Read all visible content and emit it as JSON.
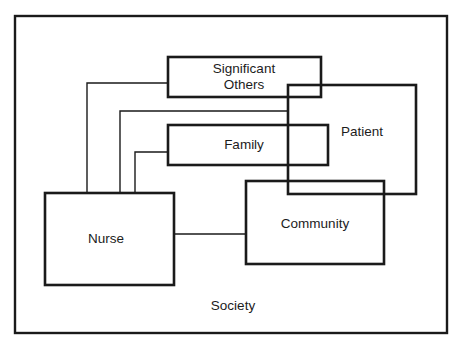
{
  "diagram": {
    "type": "nested-relationship-diagram",
    "stroke_color": "#1a1a1a",
    "background": "#ffffff",
    "nodes": [
      {
        "id": "society",
        "label": "Society",
        "box": [
          15,
          16,
          447,
          333
        ],
        "label_pos": [
          233,
          306
        ]
      },
      {
        "id": "significant_others",
        "label_line1": "Significant",
        "label_line2": "Others",
        "box": [
          168,
          57,
          321,
          97
        ],
        "label_pos": [
          244,
          77
        ]
      },
      {
        "id": "family",
        "label": "Family",
        "box": [
          168,
          125,
          328,
          165
        ],
        "label_pos": [
          244,
          145
        ]
      },
      {
        "id": "patient",
        "label": "Patient",
        "box": [
          288,
          85,
          416,
          194
        ],
        "label_pos": [
          362,
          132
        ]
      },
      {
        "id": "community",
        "label": "Community",
        "box": [
          246,
          181,
          384,
          264
        ],
        "label_pos": [
          315,
          224
        ]
      },
      {
        "id": "nurse",
        "label": "Nurse",
        "box": [
          45,
          193,
          174,
          285
        ],
        "label_pos": [
          106,
          239
        ]
      }
    ],
    "connectors": [
      {
        "from": "nurse",
        "to": "significant_others",
        "points": [
          [
            87,
            193
          ],
          [
            87,
            83
          ],
          [
            168,
            83
          ]
        ]
      },
      {
        "from": "nurse",
        "to": "patient",
        "points": [
          [
            120,
            193
          ],
          [
            120,
            111
          ],
          [
            288,
            111
          ]
        ]
      },
      {
        "from": "nurse",
        "to": "family",
        "points": [
          [
            135,
            193
          ],
          [
            135,
            152
          ],
          [
            168,
            152
          ]
        ]
      },
      {
        "from": "nurse",
        "to": "community",
        "points": [
          [
            174,
            234
          ],
          [
            246,
            234
          ]
        ]
      }
    ]
  }
}
